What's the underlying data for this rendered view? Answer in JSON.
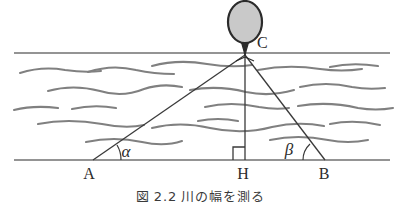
{
  "figure": {
    "caption_prefix": "図",
    "caption_number": "2.2",
    "caption_text": "川の幅を測る"
  },
  "points": [
    {
      "id": "A",
      "label": "A",
      "x": 93,
      "y": 160,
      "label_x": 89,
      "label_y": 179
    },
    {
      "id": "H",
      "label": "H",
      "x": 245,
      "y": 160,
      "label_x": 240,
      "label_y": 179
    },
    {
      "id": "B",
      "label": "B",
      "x": 325,
      "y": 160,
      "label_x": 320,
      "label_y": 179
    },
    {
      "id": "C",
      "label": "C",
      "x": 245,
      "y": 55,
      "label_x": 257,
      "label_y": 46
    }
  ],
  "angles": [
    {
      "id": "alpha",
      "label": "α",
      "at": "A",
      "label_x": 124,
      "label_y": 157
    },
    {
      "id": "beta",
      "label": "β",
      "at": "B",
      "label_x": 288,
      "label_y": 155
    }
  ],
  "right_angle": {
    "at": "H",
    "label": "right-angle-mark",
    "size": 12
  },
  "banks": {
    "near_bank_y": 160,
    "far_bank_y": 53
  },
  "tree": {
    "crown_cx": 245,
    "crown_cy": 22,
    "crown_rx": 17,
    "crown_ry": 21
  },
  "colors": {
    "line": "#3a3a3a",
    "bank": "#707070",
    "wave": "#808080",
    "crown_fill": "#c9c9c9",
    "crown_stroke": "#2b2b2b",
    "text": "#2b2b2b",
    "background": "#ffffff"
  },
  "waves": [
    "M 20 73 q 22 -7 45 -3 q 20 3 36 1",
    "M 88 72 q 24 -8 48 -2 q 18 4 38 4",
    "M 152 66 q 26 -7 55 -2 q 24 4 45 1",
    "M 258 70 q 30 -6 62 -1 q 22 3 42 0",
    "M 330 67 q 22 -5 48 -1",
    "M 48 91 q 25 -7 52 0 q 22 7 44 -2 q 18 -6 38 -2",
    "M 190 90 q 28 -5 56 2 q 24 5 48 -2",
    "M 300 87 q 26 -6 52 0 q 16 3 33 1",
    "M 14 110 q 20 -5 44 -2",
    "M 72 109 q 22 -5 44 -1",
    "M 205 107 q 26 -6 54 0 q 16 3 30 1",
    "M 298 106 q 30 -5 60 2 q 18 3 35 0",
    "M 38 124 q 30 -6 64 0 q 24 5 42 1",
    "M 152 128 q 28 -7 58 0 q 32 7 62 -1 q 26 -6 52 -1",
    "M 330 124 q 24 -5 50 1",
    "M 86 142 q 28 -6 56 0 q 22 5 40 -1",
    "M 270 140 q 28 -6 58 0 q 20 4 40 0",
    "M 198 121 q 20 -4 40 0"
  ]
}
